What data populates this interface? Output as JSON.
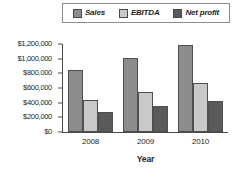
{
  "chart_data": {
    "type": "bar",
    "title": "",
    "subtitle": "",
    "xlabel": "Year",
    "ylabel": "",
    "categories": [
      "2008",
      "2009",
      "2010"
    ],
    "series": [
      {
        "name": "Sales",
        "values": [
          850000,
          1010000,
          1180000
        ],
        "color": "#8c8c8c"
      },
      {
        "name": "EBITDA",
        "values": [
          440000,
          550000,
          670000
        ],
        "color": "#c9c9c9"
      },
      {
        "name": "Net profit",
        "values": [
          270000,
          350000,
          425000
        ],
        "color": "#5a5a5a"
      }
    ],
    "ylim": [
      0,
      1200000
    ],
    "ytick_values": [
      0,
      200000,
      400000,
      600000,
      800000,
      1000000,
      1200000
    ],
    "ytick_labels": [
      "$0",
      "$200,000",
      "$400,000",
      "$600,000",
      "$800,000",
      "$1,000,000",
      "$1,200,000"
    ],
    "grid": false,
    "legend_position": "top",
    "orientation": "vertical",
    "bar_outline_color": "#4f4f4f",
    "axis_color": "#4a4a4a"
  },
  "legend": {
    "entries": [
      {
        "label": "Sales",
        "swatch_name": "legend-swatch-sales"
      },
      {
        "label": "EBITDA",
        "swatch_name": "legend-swatch-ebitda"
      },
      {
        "label": "Net profit",
        "swatch_name": "legend-swatch-net-profit"
      }
    ]
  },
  "axes": {
    "y_labels": [
      "$1,200,000",
      "$1,000,000",
      "$800,000",
      "$600,000",
      "$400,000",
      "$200,000",
      "$0"
    ],
    "x_labels": [
      "2008",
      "2009",
      "2010"
    ],
    "x_title": "Year"
  }
}
